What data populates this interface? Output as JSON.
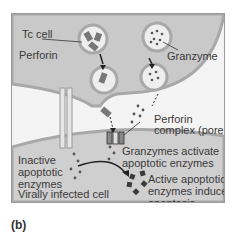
{
  "figure": {
    "panel_label": "(b)",
    "labels": {
      "tc_cell": "Tc cell",
      "perforin": "Perforin",
      "granzyme": "Granzyme",
      "perforin_complex_1": "Perforin",
      "perforin_complex_2": "complex (pore)",
      "granzymes_activate_1": "Granzymes activate",
      "granzymes_activate_2": "apoptotic enzymes",
      "inactive_1": "Inactive",
      "inactive_2": "apoptotic",
      "inactive_3": "enzymes",
      "active_1": "Active apoptotic",
      "active_2": "enzymes induce",
      "active_3": "apoptosis",
      "infected_cell": "Virally infected cell"
    },
    "colors": {
      "tc_cell_fill": "#c9c9c9",
      "infected_cell_fill": "#cfcfcf",
      "membrane": "#a8a8a8",
      "dots": "#555555",
      "active_enzyme": "#3a3a3a"
    }
  }
}
